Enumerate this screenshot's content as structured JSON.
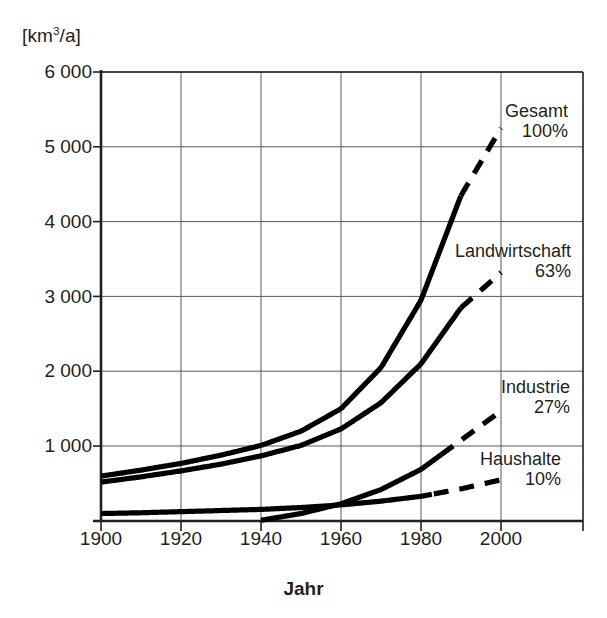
{
  "chart_data": {
    "type": "line",
    "title": "",
    "subtitle": "",
    "xlabel": "Jahr",
    "ylabel": "[km3/a]",
    "ylabel_unit_base": "[km",
    "ylabel_unit_sup": "3",
    "ylabel_unit_tail": "/a]",
    "xlim": [
      1900,
      2008
    ],
    "ylim": [
      0,
      6000
    ],
    "grid": true,
    "legend_position": "right-inline-annotations",
    "x_ticks": [
      1900,
      1920,
      1940,
      1960,
      1980,
      2000
    ],
    "x_tick_labels": [
      "1900",
      "1920",
      "1940",
      "1960",
      "1980",
      "2000"
    ],
    "y_ticks": [
      1000,
      2000,
      3000,
      4000,
      5000,
      6000
    ],
    "y_tick_labels": [
      "1 000",
      "2 000",
      "3 000",
      "4 000",
      "5 000",
      "6 000"
    ],
    "x": [
      1900,
      1910,
      1920,
      1930,
      1940,
      1950,
      1960,
      1970,
      1980,
      1990,
      2000
    ],
    "series": [
      {
        "name": "Gesamt",
        "label": "Gesamt",
        "share": "100%",
        "color": "#000000",
        "solid_until": 1990,
        "dashed_after": true,
        "values": [
          600,
          680,
          770,
          880,
          1010,
          1200,
          1500,
          2050,
          2950,
          4350,
          5250
        ]
      },
      {
        "name": "Landwirtschaft",
        "label": "Landwirtschaft",
        "share": "63%",
        "color": "#000000",
        "solid_until": 1990,
        "dashed_after": true,
        "values": [
          520,
          590,
          670,
          760,
          870,
          1010,
          1230,
          1580,
          2100,
          2850,
          3320
        ]
      },
      {
        "name": "Industrie",
        "label": "Industrie",
        "share": "27%",
        "color": "#000000",
        "solid_until": 1985,
        "dashed_after": true,
        "values": [
          null,
          null,
          null,
          null,
          10,
          100,
          230,
          420,
          690,
          1080,
          1470
        ]
      },
      {
        "name": "Haushalte",
        "label": "Haushalte",
        "share": "10%",
        "color": "#000000",
        "solid_until": 1983,
        "dashed_after": true,
        "values": [
          100,
          110,
          125,
          140,
          155,
          180,
          215,
          265,
          330,
          430,
          550
        ]
      }
    ]
  },
  "axis": {
    "x_title": "Jahr",
    "y_unit": "[km3/a]"
  }
}
